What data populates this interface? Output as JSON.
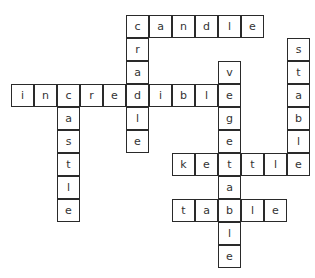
{
  "puzzle": {
    "type": "crossword",
    "cell_size": 23,
    "origin_x": 11,
    "origin_y": 84,
    "words": [
      {
        "word": "incredible",
        "direction": "across",
        "row": 0,
        "col": 0
      },
      {
        "word": "candle",
        "direction": "across",
        "row": -3,
        "col": 5
      },
      {
        "word": "cradle",
        "direction": "down",
        "row": -3,
        "col": 5
      },
      {
        "word": "castle",
        "direction": "down",
        "row": 0,
        "col": 2
      },
      {
        "word": "vegetable",
        "direction": "down",
        "row": -1,
        "col": 9
      },
      {
        "word": "stable",
        "direction": "down",
        "row": -2,
        "col": 12
      },
      {
        "word": "kettle",
        "direction": "across",
        "row": 3,
        "col": 7
      },
      {
        "word": "table",
        "direction": "across",
        "row": 5,
        "col": 7
      }
    ]
  }
}
